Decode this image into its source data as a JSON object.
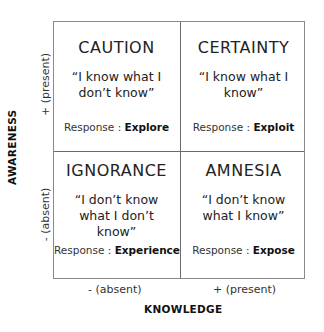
{
  "axes": {
    "x_label": "KNOWLEDGE",
    "x_ticks": [
      "-  (absent)",
      "+ (present)"
    ],
    "y_label": "AWARENESS",
    "y_ticks": [
      "+ (present)",
      "-  (absent)"
    ]
  },
  "quadrants": [
    {
      "title": "CAUTION",
      "quote": "“I know what I don’t know”",
      "response_label": "Response : ",
      "response": "Explore"
    },
    {
      "title": "CERTAINTY",
      "quote": "“I know what I know”",
      "response_label": "Response : ",
      "response": "Exploit"
    },
    {
      "title": "IGNORANCE",
      "quote": "“I don’t know what I don’t know”",
      "response_label": "Response : ",
      "response": "Experience"
    },
    {
      "title": "AMNESIA",
      "quote": "“I don’t know what I know”",
      "response_label": "Response : ",
      "response": "Expose"
    }
  ]
}
